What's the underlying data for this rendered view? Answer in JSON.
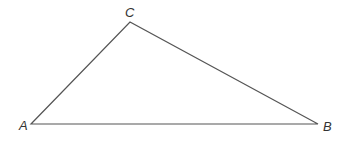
{
  "diagram": {
    "type": "triangle",
    "vertices": [
      {
        "id": "A",
        "label": "A",
        "x": 31,
        "y": 124,
        "label_x": 19,
        "label_y": 130
      },
      {
        "id": "B",
        "label": "B",
        "x": 318,
        "y": 124,
        "label_x": 323,
        "label_y": 131
      },
      {
        "id": "C",
        "label": "C",
        "x": 130,
        "y": 22,
        "label_x": 125,
        "label_y": 17
      }
    ],
    "edges": [
      [
        "A",
        "B"
      ],
      [
        "B",
        "C"
      ],
      [
        "C",
        "A"
      ]
    ],
    "stroke_color": "#555555",
    "label_color": "#333333"
  }
}
